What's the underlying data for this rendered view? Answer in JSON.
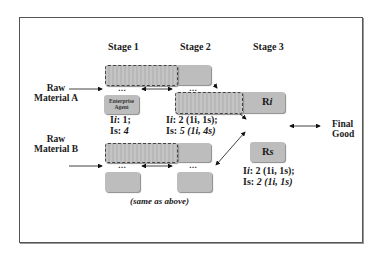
{
  "stages": [
    "Stage 1",
    "Stage 2",
    "Stage 3"
  ],
  "inputs": {
    "raw_a": [
      "Raw",
      "Material A"
    ],
    "raw_b": [
      "Raw",
      "Material B"
    ]
  },
  "output": [
    "Final",
    "Good"
  ],
  "ellipsis": "…",
  "boxes": {
    "enterprise_agent": [
      "Enterprise",
      "Agent"
    ],
    "ri_label_main": "R",
    "ri_label_sub": "i",
    "rs_label_main": "R",
    "rs_label_sub": "s"
  },
  "metrics": {
    "stage1": {
      "ii_label": "I",
      "ii_sub": "i",
      "ii_value": ": 1;",
      "is_label": "I",
      "is_sub": "s",
      "is_value": ": ",
      "is_italic": "4"
    },
    "stage2": {
      "ii_label": "I",
      "ii_sub": "i",
      "ii_value": ": 2 (1i, 1s);",
      "is_label": "I",
      "is_sub": "s",
      "is_value": ": ",
      "is_italic": "5 (1i, 4s)"
    },
    "stage3": {
      "ii_label": "I",
      "ii_sub": "i",
      "ii_value": ": 2 (1i, 1s);",
      "is_label": "I",
      "is_sub": "s",
      "is_value": ": ",
      "is_italic": "2 (1i, 1s)"
    }
  },
  "note": "(same as above)",
  "colors": {
    "box_fill": "#bdbdbd",
    "frame": "#555555",
    "text": "#1a1a1a"
  }
}
